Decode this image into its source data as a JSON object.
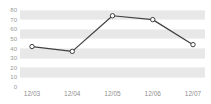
{
  "chart_data": {
    "type": "line",
    "title": "",
    "xlabel": "",
    "ylabel": "",
    "categories": [
      "12/03",
      "12/04",
      "12/05",
      "12/06",
      "12/07"
    ],
    "values": [
      42,
      37,
      74,
      70,
      44
    ],
    "series": [
      {
        "name": "series-1",
        "values": [
          42,
          37,
          74,
          70,
          44
        ]
      }
    ],
    "ylim": [
      0,
      80
    ],
    "yticks": [
      "80",
      "70",
      "60",
      "50",
      "40",
      "30",
      "20",
      "10",
      "0"
    ],
    "ytick_values": [
      80,
      70,
      60,
      50,
      40,
      30,
      20,
      10,
      0
    ],
    "grid": "horizontal-alternating-bands",
    "legend": "none",
    "line_color": "#404040",
    "marker_color": "#ffffff",
    "marker_edge_color": "#404040",
    "band_color": "#e8e8e8",
    "plot_background": "#ffffff",
    "axis_label_color": "#9a9a9a"
  },
  "top_clip": {
    "text": ""
  }
}
